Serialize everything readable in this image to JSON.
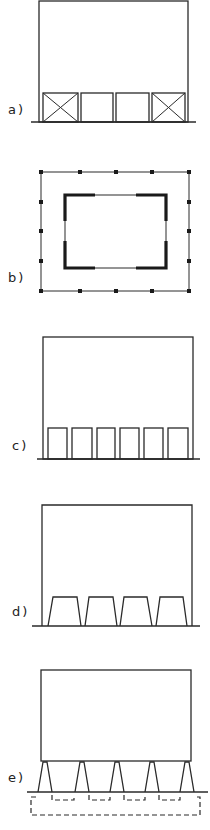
{
  "figure": {
    "panels": [
      {
        "id": "a",
        "label": "a)",
        "description": "Building on ground with four bays; outer two bays cross-braced (X)"
      },
      {
        "id": "b",
        "label": "b)",
        "description": "Plan view: outer frame with point columns, inner core with thick corner wall segments"
      },
      {
        "id": "c",
        "label": "c)",
        "description": "Building on ground with six rectangular bays at base"
      },
      {
        "id": "d",
        "label": "d)",
        "description": "Building on ground with four trapezoidal bays at base"
      },
      {
        "id": "e",
        "label": "e)",
        "description": "Building raised on five tapered legs above ground, with dashed foundation outlines below"
      }
    ],
    "colors": {
      "line": "#2a2a2a",
      "background": "#ffffff"
    }
  }
}
